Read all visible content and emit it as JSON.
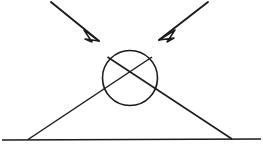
{
  "figure": {
    "canvas": {
      "width": 263,
      "height": 151,
      "background": "#ffffff"
    },
    "ink_color": "#1a1a1a",
    "elements": {
      "ground_line": {
        "name": "ground-line",
        "x1": 2,
        "y1": 140,
        "x2": 261,
        "y2": 139
      },
      "circle": {
        "name": "ball",
        "cx": 130,
        "cy": 78,
        "r": 27.5
      },
      "rail_left": {
        "name": "left-rail",
        "x1": 28,
        "y1": 139.5,
        "x2": 152,
        "y2": 57
      },
      "rail_right": {
        "name": "right-rail",
        "x1": 232,
        "y1": 139,
        "x2": 107.5,
        "y2": 57
      },
      "crossing_point": {
        "x": 130,
        "y": 113
      },
      "rail_left_ground_contact": {
        "x": 28,
        "y": 139.5
      },
      "rail_right_ground_contact": {
        "x": 232,
        "y": 139
      },
      "inner_left_ground_contact": {
        "x": 108,
        "y": 139.5
      },
      "inner_right_ground_contact": {
        "x": 152,
        "y": 139
      },
      "arrow_left": {
        "name": "left-force-arrow",
        "tail_x": 51,
        "tail_y": 2,
        "tip_x": 99,
        "tip_y": 41,
        "head_points": "99,41 84,30 92,42 85,39"
      },
      "arrow_right": {
        "name": "right-force-arrow",
        "tail_x": 208,
        "tail_y": 2,
        "tip_x": 159,
        "tip_y": 40,
        "head_points": "159,40 175,30 167,42 174,38"
      }
    }
  },
  "chart_data": {
    "type": "diagram",
    "shapes": [
      {
        "kind": "line",
        "label": "ground",
        "from": [
          2,
          140
        ],
        "to": [
          261,
          139
        ]
      },
      {
        "kind": "circle",
        "label": "ball",
        "center": [
          130,
          78
        ],
        "radius": 27.5
      },
      {
        "kind": "line",
        "label": "rail-left",
        "from": [
          28,
          139.5
        ],
        "to": [
          152,
          57
        ]
      },
      {
        "kind": "line",
        "label": "rail-right",
        "from": [
          232,
          139
        ],
        "to": [
          107.5,
          57
        ]
      },
      {
        "kind": "arrow",
        "label": "force-left",
        "from": [
          51,
          2
        ],
        "to": [
          99,
          41
        ],
        "head": "open-triangle"
      },
      {
        "kind": "arrow",
        "label": "force-right",
        "from": [
          208,
          2
        ],
        "to": [
          159,
          40
        ],
        "head": "open-triangle"
      }
    ],
    "annotations": [],
    "grid": false,
    "legend": null
  }
}
